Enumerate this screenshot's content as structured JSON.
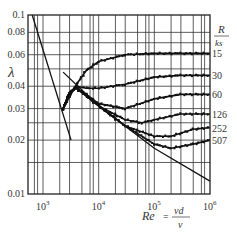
{
  "chart_data": {
    "type": "line",
    "title": "",
    "xlabel": "Re = vd/v",
    "ylabel": "λ",
    "xscale": "log",
    "yscale": "log",
    "xlim": [
      400,
      1000000
    ],
    "ylim": [
      0.01,
      0.1
    ],
    "grid": true,
    "legend_title": "R/ks",
    "x_ticks": [
      "10^3",
      "10^4",
      "10^5",
      "10^6"
    ],
    "y_ticks": [
      "0.01",
      "0.02",
      "0.03",
      "0.04",
      "0.06",
      "0.08",
      "0.1"
    ],
    "series": [
      {
        "name": "15",
        "x": [
          2300,
          3000,
          4000,
          6000,
          10000,
          30000,
          100000,
          300000,
          1000000
        ],
        "y": [
          0.03,
          0.035,
          0.041,
          0.049,
          0.055,
          0.06,
          0.061,
          0.061,
          0.061
        ]
      },
      {
        "name": "30",
        "x": [
          2300,
          3000,
          4000,
          6000,
          10000,
          30000,
          100000,
          300000,
          1000000
        ],
        "y": [
          0.03,
          0.037,
          0.04,
          0.039,
          0.039,
          0.041,
          0.045,
          0.046,
          0.046
        ]
      },
      {
        "name": "60",
        "x": [
          2300,
          3000,
          4000,
          6000,
          10000,
          30000,
          100000,
          300000,
          1000000
        ],
        "y": [
          0.03,
          0.037,
          0.039,
          0.036,
          0.032,
          0.03,
          0.034,
          0.036,
          0.036
        ]
      },
      {
        "name": "126",
        "x": [
          2300,
          3000,
          4000,
          10000,
          30000,
          60000,
          100000,
          300000,
          1000000
        ],
        "y": [
          0.03,
          0.037,
          0.039,
          0.031,
          0.026,
          0.025,
          0.026,
          0.028,
          0.028
        ]
      },
      {
        "name": "252",
        "x": [
          2300,
          3000,
          4000,
          10000,
          30000,
          100000,
          200000,
          500000,
          1000000
        ],
        "y": [
          0.03,
          0.037,
          0.039,
          0.031,
          0.024,
          0.021,
          0.021,
          0.023,
          0.0235
        ]
      },
      {
        "name": "507",
        "x": [
          2300,
          3000,
          4000,
          10000,
          30000,
          100000,
          200000,
          500000,
          1000000
        ],
        "y": [
          0.03,
          0.037,
          0.039,
          0.031,
          0.024,
          0.019,
          0.018,
          0.019,
          0.02
        ]
      },
      {
        "name": "laminar 64/Re",
        "x": [
          640,
          3200
        ],
        "y": [
          0.1,
          0.02
        ]
      },
      {
        "name": "smooth (Blasius/Prandtl)",
        "x": [
          2300,
          10000,
          100000,
          1000000
        ],
        "y": [
          0.048,
          0.031,
          0.018,
          0.0118
        ]
      }
    ],
    "annotations": [
      "R/ks",
      "15",
      "30",
      "60",
      "126",
      "252",
      "507"
    ]
  },
  "labels": {
    "ylabel": "λ",
    "legend_R": "R",
    "legend_ks": "ks",
    "x_re": "Re",
    "x_eq": "=",
    "x_num": "vd",
    "x_den": "v"
  }
}
